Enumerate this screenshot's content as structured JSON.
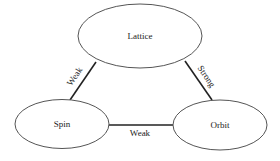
{
  "diagram": {
    "nodes": [
      {
        "id": "lattice",
        "label": "Lattice"
      },
      {
        "id": "spin",
        "label": "Spin"
      },
      {
        "id": "orbit",
        "label": "Orbit"
      }
    ],
    "edges": [
      {
        "from": "lattice",
        "to": "spin",
        "label": "Weak"
      },
      {
        "from": "lattice",
        "to": "orbit",
        "label": "Strong"
      },
      {
        "from": "spin",
        "to": "orbit",
        "label": "Weak"
      }
    ]
  }
}
